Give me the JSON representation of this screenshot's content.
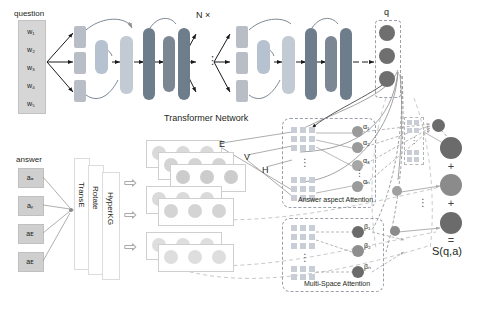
{
  "figure": {
    "type": "architecture-diagram",
    "title_visible": false
  },
  "question_module": {
    "label": "question",
    "words": [
      "w₁",
      "w₂",
      "w₃",
      "w₄",
      "w₅"
    ]
  },
  "transformer": {
    "repeat_label": "N ×",
    "caption": "Transformer Network",
    "dots": "⋮",
    "blocks": [
      {
        "name": "input-proj-1",
        "kind": "small"
      },
      {
        "name": "input-proj-2",
        "kind": "small"
      },
      {
        "name": "input-proj-3",
        "kind": "small"
      },
      {
        "name": "attn-head",
        "kind": "mid"
      },
      {
        "name": "add-norm-1",
        "kind": "light"
      },
      {
        "name": "ffn-1",
        "kind": "dark"
      },
      {
        "name": "add-norm-2",
        "kind": "dark"
      },
      {
        "name": "ffn-2",
        "kind": "dark"
      }
    ],
    "blocks_right": [
      {
        "name": "input-proj-1b",
        "kind": "small"
      },
      {
        "name": "input-proj-2b",
        "kind": "small"
      },
      {
        "name": "input-proj-3b",
        "kind": "small"
      },
      {
        "name": "attn-head-b",
        "kind": "mid"
      },
      {
        "name": "add-norm-1b",
        "kind": "light"
      },
      {
        "name": "ffn-1b",
        "kind": "dark"
      },
      {
        "name": "add-norm-2b",
        "kind": "dark"
      },
      {
        "name": "ffn-2b",
        "kind": "dark"
      }
    ]
  },
  "q_vector": {
    "label": "q",
    "cells": 3
  },
  "answer_module": {
    "label": "answer",
    "entities": [
      "aₐ",
      "aᵧ",
      "aᴇ",
      "aᴇ"
    ]
  },
  "kg_embeddings": {
    "methods": [
      "TransE",
      "Rotate",
      "HyperKG"
    ],
    "arrow_glyph": "⇨",
    "arrow_count": 3
  },
  "embedding_stack": {
    "labels": {
      "E": "E",
      "V": "V",
      "H": "H"
    },
    "planes": 6,
    "cols": 3,
    "rows": 2
  },
  "answer_aspect_attention": {
    "caption": "Answer aspect Attention",
    "weights": [
      "α₁",
      "α₂",
      "α₃",
      "αₙ"
    ],
    "dots": "⋮",
    "grid_rows": 3,
    "grid_cols": 3
  },
  "multi_space_attention": {
    "caption": "Multi-Space Attention",
    "weights": [
      "β₁",
      "β₂",
      "βₙ"
    ],
    "dots": "⋮",
    "grid_rows": 3,
    "grid_cols": 3
  },
  "scoring": {
    "operators": [
      "+",
      "+",
      "="
    ],
    "dots": "⋮",
    "result_label": "S(q,a)"
  },
  "colors": {
    "question_box": "#d6d6d6",
    "word_cell": "#c4c4c4",
    "tf_small": "#b9bec6",
    "tf_light": "#b6c2cf",
    "tf_mid": "#9aa7b5",
    "tf_dark": "#6e7d8c",
    "node_dark": "#6b6b6b",
    "node_mid": "#8e8e8e",
    "node_light": "#b0b0b0",
    "matrix_cell": "#c9ced6",
    "dash_border": "#9aa0a8",
    "arrow": "#1a1a1a",
    "text": "#231f20"
  }
}
